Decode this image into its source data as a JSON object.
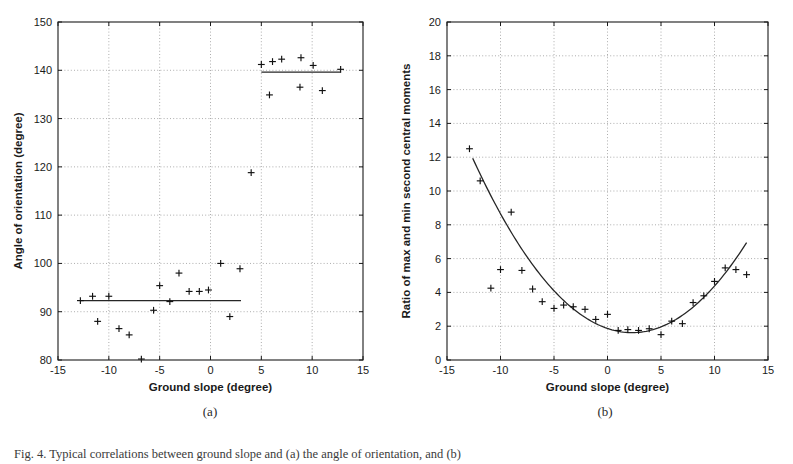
{
  "figure": {
    "panel_a_caption": "(a)",
    "panel_b_caption": "(b)",
    "bottom_caption": "Fig. 4.  Typical correlations between ground slope and (a) the angle of orientation, and (b)"
  },
  "chart_data": [
    {
      "panel": "a",
      "type": "scatter",
      "title": "",
      "xlabel": "Ground slope (degree)",
      "ylabel": "Angle of orientation (degree)",
      "xlim": [
        -15,
        15
      ],
      "ylim": [
        80,
        150
      ],
      "xticks": [
        -15,
        -10,
        -5,
        0,
        5,
        10,
        15
      ],
      "xticklabels": [
        "-15",
        "-10",
        "-5",
        "0",
        "5",
        "10",
        "15"
      ],
      "yticks": [
        80,
        90,
        100,
        110,
        120,
        130,
        140,
        150
      ],
      "yticklabels": [
        "80",
        "90",
        "100",
        "110",
        "120",
        "130",
        "140",
        "150"
      ],
      "grid": true,
      "legend": "none",
      "marker": "+",
      "points": [
        [
          -12.8,
          92.3
        ],
        [
          -11.6,
          93.2
        ],
        [
          -11.1,
          88.0
        ],
        [
          -10.0,
          93.2
        ],
        [
          -9.0,
          86.5
        ],
        [
          -8.0,
          85.2
        ],
        [
          -6.8,
          80.2
        ],
        [
          -5.6,
          90.3
        ],
        [
          -5.0,
          95.4
        ],
        [
          -4.0,
          92.1
        ],
        [
          -3.1,
          98.0
        ],
        [
          -2.1,
          94.2
        ],
        [
          -1.1,
          94.2
        ],
        [
          -0.2,
          94.5
        ],
        [
          1.0,
          100.0
        ],
        [
          1.9,
          89.0
        ],
        [
          2.9,
          98.9
        ],
        [
          4.0,
          118.8
        ],
        [
          5.0,
          141.2
        ],
        [
          5.8,
          134.9
        ],
        [
          6.1,
          141.8
        ],
        [
          7.0,
          142.3
        ],
        [
          8.8,
          136.5
        ],
        [
          8.9,
          142.6
        ],
        [
          10.1,
          141.0
        ],
        [
          11.0,
          135.8
        ],
        [
          12.8,
          140.2
        ]
      ],
      "fit_segments": [
        {
          "name": "lower-plateau",
          "x": [
            -12.8,
            3.0
          ],
          "y": [
            92.3,
            92.3
          ]
        },
        {
          "name": "upper-plateau",
          "x": [
            5.0,
            12.8
          ],
          "y": [
            139.6,
            139.6
          ]
        }
      ]
    },
    {
      "panel": "b",
      "type": "scatter",
      "title": "",
      "xlabel": "Ground slope (degree)",
      "ylabel": "Ratio of max and min second central moments",
      "xlim": [
        -15,
        15
      ],
      "ylim": [
        0,
        20
      ],
      "xticks": [
        -15,
        -10,
        -5,
        0,
        5,
        10,
        15
      ],
      "xticklabels": [
        "-15",
        "-10",
        "-5",
        "0",
        "5",
        "10",
        "15"
      ],
      "yticks": [
        0,
        2,
        4,
        6,
        8,
        10,
        12,
        14,
        16,
        18,
        20
      ],
      "yticklabels": [
        "0",
        "2",
        "4",
        "6",
        "8",
        "10",
        "12",
        "14",
        "16",
        "18",
        "20"
      ],
      "grid": true,
      "legend": "none",
      "marker": "+",
      "points": [
        [
          -12.9,
          12.5
        ],
        [
          -11.9,
          10.6
        ],
        [
          -10.9,
          4.25
        ],
        [
          -10.0,
          5.35
        ],
        [
          -9.0,
          8.75
        ],
        [
          -8.0,
          5.3
        ],
        [
          -7.0,
          4.2
        ],
        [
          -6.1,
          3.45
        ],
        [
          -5.0,
          3.05
        ],
        [
          -4.1,
          3.25
        ],
        [
          -3.2,
          3.15
        ],
        [
          -2.1,
          3.0
        ],
        [
          -1.1,
          2.4
        ],
        [
          0.0,
          2.7
        ],
        [
          1.0,
          1.75
        ],
        [
          1.9,
          1.8
        ],
        [
          2.9,
          1.75
        ],
        [
          3.9,
          1.85
        ],
        [
          5.0,
          1.5
        ],
        [
          6.0,
          2.3
        ],
        [
          7.0,
          2.15
        ],
        [
          8.0,
          3.4
        ],
        [
          9.0,
          3.8
        ],
        [
          10.0,
          4.65
        ],
        [
          11.0,
          5.45
        ],
        [
          12.0,
          5.35
        ],
        [
          13.0,
          5.05
        ]
      ],
      "fit_curve": {
        "name": "quadratic-fit",
        "description": "parabolic fit with minimum near x=2",
        "a": 0.0465,
        "h": 2.3,
        "k": 1.62,
        "x_range": [
          -12.6,
          13.0
        ]
      }
    }
  ]
}
